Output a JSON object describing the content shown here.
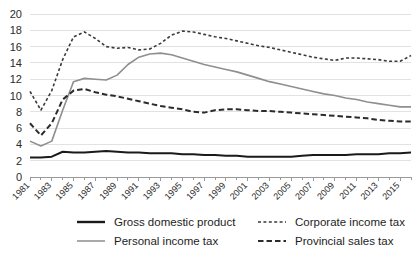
{
  "chart_data": {
    "type": "line",
    "title": "",
    "subtitle": "",
    "xlabel": "",
    "ylabel": "",
    "xlim": [
      1981,
      2016
    ],
    "ylim": [
      0,
      20
    ],
    "yticks": [
      0,
      2,
      4,
      6,
      8,
      10,
      12,
      14,
      16,
      18,
      20
    ],
    "grid": "horizontal",
    "legend_position": "bottom",
    "x": [
      1981,
      1982,
      1983,
      1984,
      1985,
      1986,
      1987,
      1988,
      1989,
      1990,
      1991,
      1992,
      1993,
      1994,
      1995,
      1996,
      1997,
      1998,
      1999,
      2000,
      2001,
      2002,
      2003,
      2004,
      2005,
      2006,
      2007,
      2008,
      2009,
      2010,
      2011,
      2012,
      2013,
      2014,
      2015,
      2016
    ],
    "xtick_labels": [
      "1981",
      "1983",
      "1985",
      "1987",
      "1989",
      "1991",
      "1993",
      "1995",
      "1997",
      "1999",
      "2001",
      "2003",
      "2005",
      "2007",
      "2009",
      "2011",
      "2013",
      "2015"
    ],
    "series": [
      {
        "name": "Gross domestic product",
        "style": "solid",
        "color": "#1a1a1a",
        "width": 2.0,
        "values": [
          2.4,
          2.4,
          2.5,
          3.1,
          3.0,
          3.0,
          3.1,
          3.2,
          3.1,
          3.0,
          3.0,
          2.9,
          2.9,
          2.9,
          2.8,
          2.8,
          2.7,
          2.7,
          2.6,
          2.6,
          2.5,
          2.5,
          2.5,
          2.5,
          2.5,
          2.6,
          2.7,
          2.7,
          2.7,
          2.7,
          2.8,
          2.8,
          2.8,
          2.9,
          2.9,
          3.0
        ]
      },
      {
        "name": "Personal income tax",
        "style": "solid",
        "color": "#8f8f8f",
        "width": 1.6,
        "values": [
          4.4,
          3.8,
          4.4,
          8.2,
          11.7,
          12.1,
          12.0,
          11.9,
          12.5,
          13.8,
          14.7,
          15.1,
          15.2,
          15.0,
          14.6,
          14.2,
          13.8,
          13.5,
          13.2,
          12.9,
          12.5,
          12.1,
          11.7,
          11.4,
          11.1,
          10.8,
          10.5,
          10.2,
          10.0,
          9.7,
          9.5,
          9.2,
          9.0,
          8.8,
          8.6,
          8.6
        ]
      },
      {
        "name": "Corporate income tax",
        "style": "dotted",
        "color": "#3a3a3a",
        "width": 1.6,
        "values": [
          10.5,
          8.2,
          10.6,
          14.4,
          17.2,
          17.8,
          17.0,
          16.0,
          15.8,
          15.9,
          15.6,
          15.7,
          16.4,
          17.4,
          17.9,
          17.8,
          17.5,
          17.2,
          17.0,
          16.7,
          16.4,
          16.1,
          15.9,
          15.6,
          15.3,
          15.0,
          14.7,
          14.5,
          14.3,
          14.6,
          14.6,
          14.5,
          14.4,
          14.2,
          14.2,
          14.9
        ]
      },
      {
        "name": "Provincial sales tax",
        "style": "dashed",
        "color": "#2b2b2b",
        "width": 2.0,
        "values": [
          6.6,
          5.1,
          6.6,
          9.5,
          10.6,
          10.8,
          10.4,
          10.1,
          9.9,
          9.6,
          9.3,
          9.0,
          8.7,
          8.5,
          8.3,
          8.0,
          7.9,
          8.2,
          8.3,
          8.3,
          8.2,
          8.1,
          8.1,
          8.0,
          7.9,
          7.8,
          7.7,
          7.6,
          7.5,
          7.4,
          7.3,
          7.2,
          7.0,
          6.9,
          6.8,
          6.8
        ]
      }
    ]
  },
  "legend": {
    "items": [
      {
        "label": "Gross domestic product",
        "series": 0
      },
      {
        "label": "Personal income tax",
        "series": 1
      },
      {
        "label": "Corporate income tax",
        "series": 2
      },
      {
        "label": "Provincial sales tax",
        "series": 3
      }
    ]
  }
}
